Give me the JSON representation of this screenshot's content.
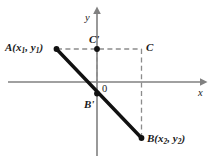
{
  "figure": {
    "type": "coordinate-geometry-diagram",
    "background_color": "#ffffff",
    "axis_color": "#808080",
    "segment_color": "#111111",
    "dash_color": "#8c8c8c",
    "label_color": "#1a1a1a",
    "axes": {
      "x_label": "x",
      "y_label": "y",
      "origin_label": "0"
    },
    "points": [
      {
        "id": "A",
        "name": "point-a",
        "label_name": "A",
        "label_open": "(",
        "label_var1": "x",
        "label_sub1": "1",
        "label_comma": ", ",
        "label_var2": "y",
        "label_sub2": "1",
        "label_close": ")",
        "x": 56.5,
        "y": 49.0,
        "dot": true
      },
      {
        "id": "B",
        "name": "point-b",
        "label_name": "B",
        "label_open": "(",
        "label_var1": "x",
        "label_sub1": "2",
        "label_comma": ", ",
        "label_var2": "y",
        "label_sub2": "2",
        "label_close": ")",
        "x": 141.5,
        "y": 138.0,
        "dot": true
      },
      {
        "id": "Cprime",
        "name": "point-c-prime",
        "label_name": "C'",
        "x": 97.0,
        "y": 49.0,
        "dot": true
      },
      {
        "id": "C",
        "name": "point-c",
        "label_name": "C",
        "x": 141.5,
        "y": 49.0,
        "dot": false
      },
      {
        "id": "Bprime",
        "name": "point-b-prime",
        "label_name": "B'",
        "x": 97.0,
        "y": 93.5,
        "dot": true
      }
    ],
    "labels": {
      "a_text": "A(x1, y1)",
      "b_text": "B(x2, y2)",
      "c_prime_text": "C'",
      "c_text": "C",
      "b_prime_text": "B'",
      "origin_text": "0",
      "x_axis_text": "x",
      "y_axis_text": "y"
    },
    "segment": {
      "name": "segment-ab",
      "from": "A",
      "through": "B'",
      "to": "B",
      "stroke_width": 3.4
    },
    "dashed_lines": [
      {
        "name": "dashed-a-to-c",
        "from": "A",
        "to": "C",
        "orientation": "horizontal"
      },
      {
        "name": "dashed-c-to-b",
        "from": "C",
        "to": "B",
        "orientation": "vertical"
      },
      {
        "name": "dashed-cprime-to-bprime",
        "from": "C'",
        "to": "B'",
        "orientation": "vertical"
      }
    ]
  }
}
